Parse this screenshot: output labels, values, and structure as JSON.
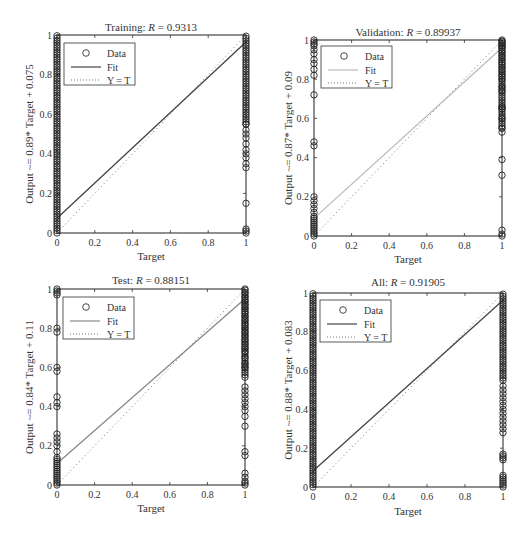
{
  "chart_data": [
    {
      "type": "scatter",
      "title": "Training: R = 0.9313",
      "title_prefix": "Training: ",
      "title_R": "R",
      "title_value": " = 0.9313",
      "xlabel": "Target",
      "ylabel": "Output ~= 0.89* Target + 0.075",
      "xlim": [
        0,
        1
      ],
      "ylim": [
        0,
        1
      ],
      "xticks": [
        "0",
        "0.2",
        "0.4",
        "0.6",
        "0.8",
        "1"
      ],
      "yticks": [
        "0",
        "0.2",
        "0.4",
        "0.6",
        "0.8",
        "1"
      ],
      "fit": {
        "slope": 0.89,
        "intercept": 0.075,
        "color": "#444444"
      },
      "legend": [
        "Data",
        "Fit",
        "Y = T"
      ],
      "box": {
        "left": 57,
        "top": 35,
        "right": 246,
        "bottom": 233
      },
      "show_xlabel": true,
      "data_at_0": "dense from 0 to 1",
      "data_at_1": "dense from 0.33 to 1, sparse near 0.15, 0.02, 0"
    },
    {
      "type": "scatter",
      "title": "Validation: R = 0.89937",
      "title_prefix": "Validation: ",
      "title_R": "R",
      "title_value": " = 0.89937",
      "xlabel": "Target",
      "ylabel": "Output ~= 0.87* Target + 0.09",
      "xlim": [
        0,
        1
      ],
      "ylim": [
        0,
        1
      ],
      "xticks": [
        "0",
        "0.2",
        "0.4",
        "0.6",
        "0.8",
        "1"
      ],
      "yticks": [
        "0",
        "0.2",
        "0.4",
        "0.6",
        "0.8",
        "1"
      ],
      "fit": {
        "slope": 0.87,
        "intercept": 0.09,
        "color": "#bbbbbb"
      },
      "legend": [
        "Data",
        "Fit",
        "Y = T"
      ],
      "box": {
        "left": 314,
        "top": 40,
        "right": 502,
        "bottom": 236
      },
      "show_xlabel": true,
      "data_at_0": "0-0.2, 0.46, 0.72, 0.82-1",
      "data_at_1": "0, 0.03, 0.31, 0.39, 0.53-1"
    },
    {
      "type": "scatter",
      "title": "Test: R = 0.88151",
      "title_prefix": "Test: ",
      "title_R": "R",
      "title_value": " = 0.88151",
      "xlabel": "Target",
      "ylabel": "Output ~= 0.84* Target + 0.11",
      "xlim": [
        0,
        1
      ],
      "ylim": [
        0,
        1
      ],
      "xticks": [
        "0",
        "0.2",
        "0.4",
        "0.6",
        "0.8",
        "1"
      ],
      "yticks": [
        "0",
        "0.2",
        "0.4",
        "0.6",
        "0.8",
        "1"
      ],
      "fit": {
        "slope": 0.84,
        "intercept": 0.11,
        "color": "#888888"
      },
      "legend": [
        "Data",
        "Fit",
        "Y = T"
      ],
      "box": {
        "left": 57,
        "top": 289,
        "right": 245,
        "bottom": 485
      },
      "show_xlabel": true,
      "data_at_0": "0-0.27, 0.4-0.45, 0.58-0.6, 0.78-0.8, 0.97-1",
      "data_at_1": "0-0.06, 0.15-0.17, 0.3, 0.35-0.5, 0.6-1"
    },
    {
      "type": "scatter",
      "title": "All: R = 0.91905",
      "title_prefix": "All: ",
      "title_R": "R",
      "title_value": " = 0.91905",
      "xlabel": "Target",
      "ylabel": "Output ~= 0.88* Target + 0.083",
      "xlim": [
        0,
        1
      ],
      "ylim": [
        0,
        1
      ],
      "xticks": [
        "0",
        "0.2",
        "0.4",
        "0.6",
        "0.8",
        "1"
      ],
      "yticks": [
        "0",
        "0.2",
        "0.4",
        "0.6",
        "0.8",
        "1"
      ],
      "fit": {
        "slope": 0.88,
        "intercept": 0.083,
        "color": "#444444"
      },
      "legend": [
        "Data",
        "Fit",
        "Y = T"
      ],
      "box": {
        "left": 313,
        "top": 293,
        "right": 503,
        "bottom": 487
      },
      "show_xlabel": true,
      "data_at_0": "dense from 0 to 1",
      "data_at_1": "0-0.06, 0.14-0.17, 0.28-1"
    }
  ],
  "panels": [
    {
      "title_prefix": "Training: ",
      "title_R": "R",
      "title_value": " = 0.9313",
      "xlabel": "Target",
      "ylabel": "Output ~= 0.89* Target + 0.075",
      "legend": {
        "data": "Data",
        "fit": "Fit",
        "yt": "Y = T"
      }
    },
    {
      "title_prefix": "Validation: ",
      "title_R": "R",
      "title_value": " = 0.89937",
      "xlabel": "Target",
      "ylabel": "Output ~= 0.87* Target + 0.09",
      "legend": {
        "data": "Data",
        "fit": "Fit",
        "yt": "Y = T"
      }
    },
    {
      "title_prefix": "Test: ",
      "title_R": "R",
      "title_value": " = 0.88151",
      "xlabel": "Target",
      "ylabel": "Output ~= 0.84* Target + 0.11",
      "legend": {
        "data": "Data",
        "fit": "Fit",
        "yt": "Y = T"
      }
    },
    {
      "title_prefix": "All: ",
      "title_R": "R",
      "title_value": " = 0.91905",
      "xlabel": "Target",
      "ylabel": "Output ~= 0.88* Target + 0.083",
      "legend": {
        "data": "Data",
        "fit": "Fit",
        "yt": "Y = T"
      }
    }
  ],
  "ticks": [
    "0",
    "0.2",
    "0.4",
    "0.6",
    "0.8",
    "1"
  ]
}
